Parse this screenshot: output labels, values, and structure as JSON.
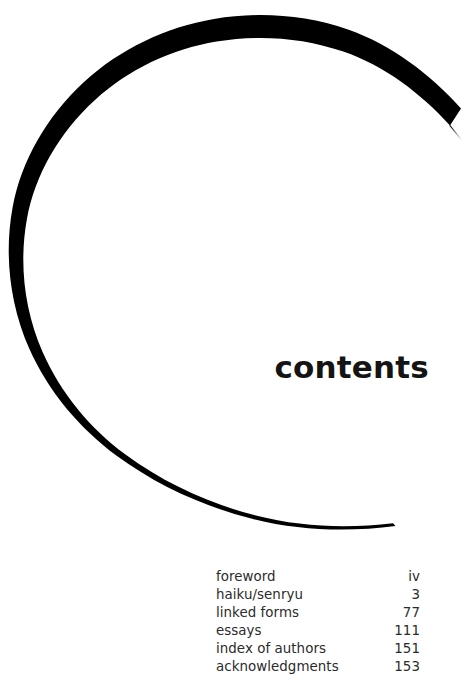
{
  "page": {
    "background_color": "#ffffff",
    "width": 465,
    "height": 684
  },
  "decoration": {
    "shape_name": "brush-stroke-circle",
    "description": "open tapered ink circle",
    "color": "#000000",
    "center_x": 235,
    "center_y": 277,
    "radius": 225,
    "max_stroke_width": 8,
    "min_stroke_width": 0
  },
  "title": {
    "text": "contents",
    "color": "#141414"
  },
  "toc": {
    "text_color": "#2b2b2b",
    "entries": [
      {
        "label": "foreword",
        "page": "iv"
      },
      {
        "label": "haiku/senryu",
        "page": "3"
      },
      {
        "label": "linked forms",
        "page": "77"
      },
      {
        "label": "essays",
        "page": "111"
      },
      {
        "label": "index of authors",
        "page": "151"
      },
      {
        "label": "acknowledgments",
        "page": "153"
      }
    ]
  }
}
